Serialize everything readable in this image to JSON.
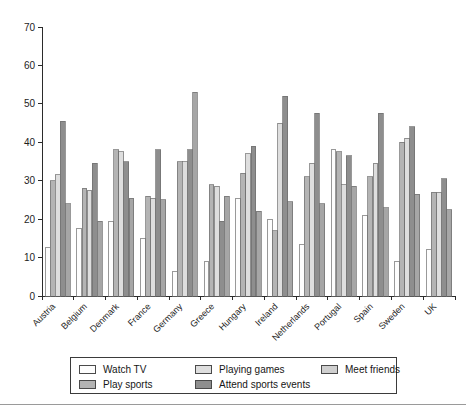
{
  "top_remnant_text": "",
  "chart_data": {
    "type": "bar",
    "title": "",
    "subtitle": "",
    "xlabel": "",
    "ylabel": "",
    "ylim": [
      0,
      70
    ],
    "ytick_step": 10,
    "yticks": [
      0,
      10,
      20,
      30,
      40,
      50,
      60,
      70
    ],
    "grid": false,
    "legend_position": "bottom",
    "categories": [
      "Austria",
      "Belgium",
      "Denmark",
      "France",
      "Germany",
      "Greece",
      "Hungary",
      "Ireland",
      "Netherlands",
      "Portugal",
      "Spain",
      "Sweden",
      "UK"
    ],
    "series": [
      {
        "name": "Watch TV",
        "color": "#fdfdfd",
        "values": [
          12.5,
          17.5,
          19.5,
          15.0,
          6.5,
          9.0,
          25.5,
          20.0,
          13.5,
          38.0,
          21.0,
          9.0,
          12.0
        ]
      },
      {
        "name": "Play sports",
        "color": "#b4b4b4",
        "values": [
          30.0,
          28.0,
          38.0,
          26.0,
          35.0,
          29.0,
          32.0,
          17.0,
          31.0,
          37.5,
          31.0,
          40.0,
          27.0
        ]
      },
      {
        "name": "Playing games",
        "color": "#dedede",
        "values": [
          31.5,
          27.5,
          37.5,
          25.5,
          35.0,
          28.5,
          37.0,
          45.0,
          34.5,
          29.0,
          34.5,
          41.0,
          27.0
        ]
      },
      {
        "name": "Attend sports events",
        "color": "#8e8e8e",
        "values": [
          45.5,
          34.5,
          35.0,
          38.0,
          38.0,
          19.5,
          39.0,
          52.0,
          47.5,
          36.5,
          47.5,
          44.0,
          30.5
        ]
      },
      {
        "name": "Meet friends",
        "color": "#a6a6a6",
        "values": [
          24.0,
          19.5,
          25.5,
          25.0,
          53.0,
          26.0,
          22.0,
          24.5,
          24.0,
          28.5,
          23.0,
          26.5,
          22.5
        ]
      }
    ]
  },
  "legend": {
    "items": [
      {
        "label": "Watch TV",
        "color": "#fdfdfd"
      },
      {
        "label": "Playing games",
        "color": "#dedede"
      },
      {
        "label": "Meet friends",
        "color": "#cfcfcf"
      },
      {
        "label": "Play sports",
        "color": "#b4b4b4"
      },
      {
        "label": "Attend sports events",
        "color": "#8e8e8e"
      }
    ]
  }
}
